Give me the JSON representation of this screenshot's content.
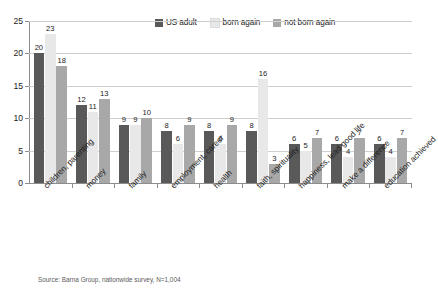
{
  "chart_data": {
    "type": "bar",
    "title": "",
    "xlabel": "",
    "ylabel": "",
    "ylim": [
      0,
      25
    ],
    "yticks": [
      0,
      5,
      10,
      15,
      20,
      25
    ],
    "grid": true,
    "legend_position": "top-right",
    "categories": [
      "children, parenting",
      "money",
      "family",
      "employment, career",
      "health",
      "faith, spirituality",
      "happiness, lead good life",
      "make a difference",
      "education achieved"
    ],
    "series": [
      {
        "name": "US adult",
        "color": "#595959",
        "values": [
          20,
          12,
          9,
          8,
          8,
          8,
          6,
          6,
          6
        ]
      },
      {
        "name": "born again",
        "color": "#e8e8e8",
        "values": [
          23,
          11,
          9,
          6,
          6,
          16,
          5,
          4,
          4
        ]
      },
      {
        "name": "not born again",
        "color": "#a8a8a8",
        "values": [
          18,
          13,
          10,
          9,
          9,
          3,
          7,
          7,
          7
        ]
      }
    ],
    "source_note": "Source: Barna Group, nationwide survey, N=1,004"
  }
}
